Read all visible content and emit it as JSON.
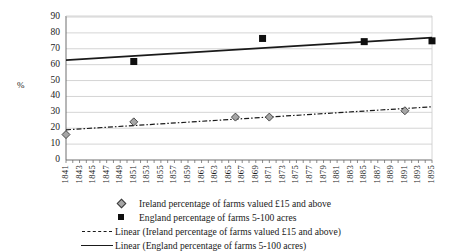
{
  "chart_data": {
    "type": "scatter",
    "title": "",
    "xlabel": "",
    "ylabel": "%",
    "ylim": [
      0,
      90
    ],
    "ytick_step": 10,
    "xlim": [
      1841,
      1895
    ],
    "grid": true,
    "legend_position": "bottom",
    "yticks": [
      "90",
      "80",
      "70",
      "60",
      "50",
      "40",
      "30",
      "20",
      "10",
      "0"
    ],
    "xticks": [
      "1841",
      "1843",
      "1845",
      "1847",
      "1849",
      "1851",
      "1853",
      "1855",
      "1857",
      "1859",
      "1861",
      "1863",
      "1865",
      "1867",
      "1869",
      "1871",
      "1873",
      "1875",
      "1877",
      "1879",
      "1881",
      "1883",
      "1885",
      "1887",
      "1889",
      "1891",
      "1893",
      "1895"
    ],
    "series": [
      {
        "name": "Ireland percentage of farms valued £15 and above",
        "marker": "diamond",
        "color": "#a6a6a6",
        "points": [
          {
            "x": 1841,
            "y": 16
          },
          {
            "x": 1851,
            "y": 24
          },
          {
            "x": 1866,
            "y": 27
          },
          {
            "x": 1871,
            "y": 27
          },
          {
            "x": 1891,
            "y": 31
          }
        ]
      },
      {
        "name": "England percentage of farms 5-100 acres",
        "marker": "square",
        "color": "#0f0f0f",
        "points": [
          {
            "x": 1851,
            "y": 62
          },
          {
            "x": 1870,
            "y": 76.5
          },
          {
            "x": 1885,
            "y": 74.5
          },
          {
            "x": 1895,
            "y": 75
          }
        ]
      }
    ],
    "trendlines": [
      {
        "name": "Linear (Ireland percentage of farms valued £15 and above)",
        "style": "dash-dot",
        "color": "#1a1a1a",
        "start": {
          "x": 1841,
          "y": 19
        },
        "end": {
          "x": 1895,
          "y": 33.5
        }
      },
      {
        "name": "Linear (England percentage of farms 5-100 acres)",
        "style": "solid",
        "color": "#1a1a1a",
        "start": {
          "x": 1841,
          "y": 62.8
        },
        "end": {
          "x": 1895,
          "y": 77
        }
      }
    ]
  },
  "axis": {
    "y_title": "%"
  },
  "legend": {
    "items": [
      {
        "key": "diamond-marker",
        "label": "Ireland percentage of farms valued £15 and above"
      },
      {
        "key": "square-marker",
        "label": "England percentage of farms 5-100 acres"
      },
      {
        "key": "dash-dot-line",
        "label": "Linear (Ireland percentage of farms valued £15 and above)"
      },
      {
        "key": "solid-line",
        "label": "Linear (England percentage of farms 5-100 acres)"
      }
    ]
  }
}
